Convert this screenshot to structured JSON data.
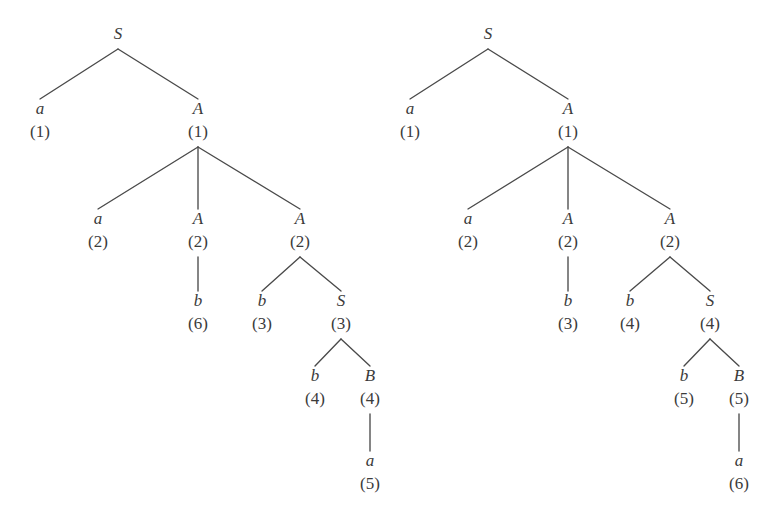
{
  "figure": {
    "background_color": "#ffffff",
    "text_color": "#3b3b3b",
    "edge_color": "#4a4a4a",
    "trees": [
      {
        "id": "left-tree",
        "name": "left-parse-tree",
        "nodes": [
          {
            "key": "l-s-root",
            "symbol": "S",
            "index": "",
            "x": 118,
            "y": 33
          },
          {
            "key": "l-a-1",
            "symbol": "a",
            "index": "(1)",
            "x": 40,
            "y": 108
          },
          {
            "key": "l-A-1",
            "symbol": "A",
            "index": "(1)",
            "x": 198,
            "y": 108
          },
          {
            "key": "l-a-2",
            "symbol": "a",
            "index": "(2)",
            "x": 98,
            "y": 218
          },
          {
            "key": "l-A-2a",
            "symbol": "A",
            "index": "(2)",
            "x": 198,
            "y": 218
          },
          {
            "key": "l-A-2b",
            "symbol": "A",
            "index": "(2)",
            "x": 300,
            "y": 218
          },
          {
            "key": "l-b-6",
            "symbol": "b",
            "index": "(6)",
            "x": 198,
            "y": 300
          },
          {
            "key": "l-b-3",
            "symbol": "b",
            "index": "(3)",
            "x": 262,
            "y": 300
          },
          {
            "key": "l-S-3",
            "symbol": "S",
            "index": "(3)",
            "x": 341,
            "y": 300
          },
          {
            "key": "l-b-4",
            "symbol": "b",
            "index": "(4)",
            "x": 315,
            "y": 375
          },
          {
            "key": "l-B-4",
            "symbol": "B",
            "index": "(4)",
            "x": 370,
            "y": 375
          },
          {
            "key": "l-a-5",
            "symbol": "a",
            "index": "(5)",
            "x": 370,
            "y": 460
          }
        ],
        "edges": [
          {
            "key": "l-e1",
            "from": "l-s-root",
            "to": "l-a-1"
          },
          {
            "key": "l-e2",
            "from": "l-s-root",
            "to": "l-A-1"
          },
          {
            "key": "l-e3",
            "from": "l-A-1",
            "to": "l-a-2"
          },
          {
            "key": "l-e4",
            "from": "l-A-1",
            "to": "l-A-2a"
          },
          {
            "key": "l-e5",
            "from": "l-A-1",
            "to": "l-A-2b"
          },
          {
            "key": "l-e6",
            "from": "l-A-2a",
            "to": "l-b-6"
          },
          {
            "key": "l-e7",
            "from": "l-A-2b",
            "to": "l-b-3"
          },
          {
            "key": "l-e8",
            "from": "l-A-2b",
            "to": "l-S-3"
          },
          {
            "key": "l-e9",
            "from": "l-S-3",
            "to": "l-b-4"
          },
          {
            "key": "l-e10",
            "from": "l-S-3",
            "to": "l-B-4"
          },
          {
            "key": "l-e11",
            "from": "l-B-4",
            "to": "l-a-5"
          }
        ]
      },
      {
        "id": "right-tree",
        "name": "right-parse-tree",
        "nodes": [
          {
            "key": "r-s-root",
            "symbol": "S",
            "index": "",
            "x": 488,
            "y": 33
          },
          {
            "key": "r-a-1",
            "symbol": "a",
            "index": "(1)",
            "x": 410,
            "y": 108
          },
          {
            "key": "r-A-1",
            "symbol": "A",
            "index": "(1)",
            "x": 568,
            "y": 108
          },
          {
            "key": "r-a-2",
            "symbol": "a",
            "index": "(2)",
            "x": 468,
            "y": 218
          },
          {
            "key": "r-A-2a",
            "symbol": "A",
            "index": "(2)",
            "x": 568,
            "y": 218
          },
          {
            "key": "r-A-2b",
            "symbol": "A",
            "index": "(2)",
            "x": 670,
            "y": 218
          },
          {
            "key": "r-b-3",
            "symbol": "b",
            "index": "(3)",
            "x": 568,
            "y": 300
          },
          {
            "key": "r-b-4",
            "symbol": "b",
            "index": "(4)",
            "x": 630,
            "y": 300
          },
          {
            "key": "r-S-4",
            "symbol": "S",
            "index": "(4)",
            "x": 710,
            "y": 300
          },
          {
            "key": "r-b-5",
            "symbol": "b",
            "index": "(5)",
            "x": 684,
            "y": 375
          },
          {
            "key": "r-B-5",
            "symbol": "B",
            "index": "(5)",
            "x": 739,
            "y": 375
          },
          {
            "key": "r-a-6",
            "symbol": "a",
            "index": "(6)",
            "x": 739,
            "y": 460
          }
        ],
        "edges": [
          {
            "key": "r-e1",
            "from": "r-s-root",
            "to": "r-a-1"
          },
          {
            "key": "r-e2",
            "from": "r-s-root",
            "to": "r-A-1"
          },
          {
            "key": "r-e3",
            "from": "r-A-1",
            "to": "r-a-2"
          },
          {
            "key": "r-e4",
            "from": "r-A-1",
            "to": "r-A-2a"
          },
          {
            "key": "r-e5",
            "from": "r-A-1",
            "to": "r-A-2b"
          },
          {
            "key": "r-e6",
            "from": "r-A-2a",
            "to": "r-b-3"
          },
          {
            "key": "r-e7",
            "from": "r-A-2b",
            "to": "r-b-4"
          },
          {
            "key": "r-e8",
            "from": "r-A-2b",
            "to": "r-S-4"
          },
          {
            "key": "r-e9",
            "from": "r-S-4",
            "to": "r-b-5"
          },
          {
            "key": "r-e10",
            "from": "r-S-4",
            "to": "r-B-5"
          },
          {
            "key": "r-e11",
            "from": "r-B-5",
            "to": "r-a-6"
          }
        ]
      }
    ]
  }
}
